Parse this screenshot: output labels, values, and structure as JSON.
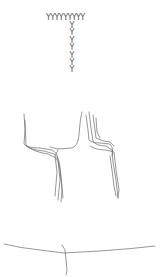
{
  "top_text": {
    "row": "YYYYYYYYY",
    "column": [
      "Y",
      "Y",
      "Y",
      "Y",
      "Y",
      "Y",
      "Y"
    ]
  },
  "colors": {
    "background": "#ffffff",
    "stroke": "#666666",
    "text": "#555555"
  }
}
